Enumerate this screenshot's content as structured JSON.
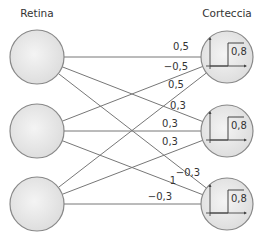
{
  "titles": {
    "retina": "Retina",
    "cortex": "Corteccia"
  },
  "retina_nodes": [
    {
      "cx": 37,
      "cy": 57,
      "r": 27
    },
    {
      "cx": 37,
      "cy": 131,
      "r": 27
    },
    {
      "cx": 37,
      "cy": 204,
      "r": 27
    }
  ],
  "cortex_nodes": [
    {
      "cx": 227,
      "cy": 57,
      "r": 26,
      "threshold": "0,8"
    },
    {
      "cx": 227,
      "cy": 131,
      "r": 26,
      "threshold": "0,8"
    },
    {
      "cx": 227,
      "cy": 204,
      "r": 26,
      "threshold": "0,8"
    }
  ],
  "connections": [
    {
      "from": 0,
      "to": 0,
      "weight": "0,5",
      "lx": 181,
      "ly": 50
    },
    {
      "from": 0,
      "to": 1,
      "weight": "0,3",
      "lx": 178,
      "ly": 109
    },
    {
      "from": 0,
      "to": 2,
      "weight": "-0,3",
      "lx": 188,
      "ly": 176
    },
    {
      "from": 1,
      "to": 0,
      "weight": "-0,5",
      "lx": 176,
      "ly": 70
    },
    {
      "from": 1,
      "to": 1,
      "weight": "0,3",
      "lx": 170,
      "ly": 127
    },
    {
      "from": 1,
      "to": 2,
      "weight": "1",
      "lx": 173,
      "ly": 184
    },
    {
      "from": 2,
      "to": 0,
      "weight": "0,5",
      "lx": 176,
      "ly": 88
    },
    {
      "from": 2,
      "to": 1,
      "weight": "0,3",
      "lx": 170,
      "ly": 145
    },
    {
      "from": 2,
      "to": 2,
      "weight": "-0,3",
      "lx": 160,
      "ly": 200
    }
  ]
}
